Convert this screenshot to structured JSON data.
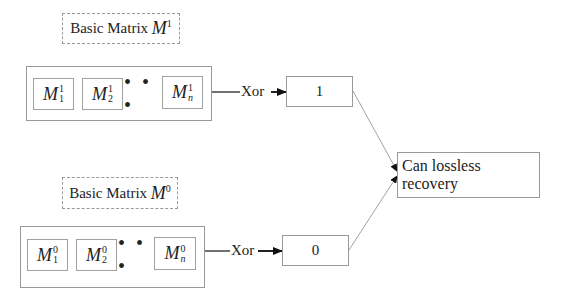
{
  "diagram": {
    "groups": [
      {
        "id": "m1",
        "title_text": "Basic Matrix",
        "title_symbol": "M",
        "title_superscript": "1",
        "cells": [
          {
            "symbol": "M",
            "sup": "1",
            "sub": "1"
          },
          {
            "symbol": "M",
            "sup": "1",
            "sub": "2"
          },
          {
            "symbol": "M",
            "sup": "1",
            "sub": "n"
          }
        ],
        "ellipsis": "• • •",
        "operation": "Xor",
        "result": "1"
      },
      {
        "id": "m0",
        "title_text": "Basic Matrix",
        "title_symbol": "M",
        "title_superscript": "0",
        "cells": [
          {
            "symbol": "M",
            "sup": "0",
            "sub": "1"
          },
          {
            "symbol": "M",
            "sup": "0",
            "sub": "2"
          },
          {
            "symbol": "M",
            "sup": "0",
            "sub": "n"
          }
        ],
        "ellipsis": "• • •",
        "operation": "Xor",
        "result": "0"
      }
    ],
    "output": "Can lossless recovery",
    "colors": {
      "line": "#222222",
      "border": "#9a9a9a",
      "thin_line": "#8a8a8a"
    }
  }
}
